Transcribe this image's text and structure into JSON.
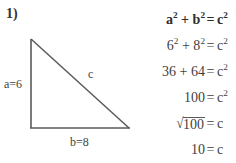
{
  "problem": {
    "number_label": "1)"
  },
  "figure": {
    "name": "right-triangle",
    "leg_vertical_label": "a=6",
    "leg_horizontal_label": "b=8",
    "hypotenuse_label": "c",
    "stroke_color": "#5a5a5a",
    "vertices": {
      "apex": [
        31,
        39
      ],
      "right_angle": [
        31,
        128
      ],
      "bottom_right": [
        129,
        128
      ]
    },
    "leg_vertical_length": 6,
    "leg_horizontal_length": 8
  },
  "equations": [
    {
      "lhs": "a² + b²",
      "relation": "=",
      "rhs": "c²",
      "bold": true,
      "style": "plain"
    },
    {
      "lhs": "6² + 8²",
      "relation": "=",
      "rhs": "c²",
      "bold": false,
      "style": "plain"
    },
    {
      "lhs": "36 + 64",
      "relation": "=",
      "rhs": "c²",
      "bold": false,
      "style": "plain"
    },
    {
      "lhs": "100",
      "relation": "=",
      "rhs": "c²",
      "bold": false,
      "style": "plain"
    },
    {
      "lhs": "√100",
      "relation": "=",
      "rhs": "c",
      "bold": false,
      "style": "radical",
      "radicand": "100"
    },
    {
      "lhs": "10",
      "relation": "=",
      "rhs": "c",
      "bold": false,
      "style": "plain"
    }
  ]
}
